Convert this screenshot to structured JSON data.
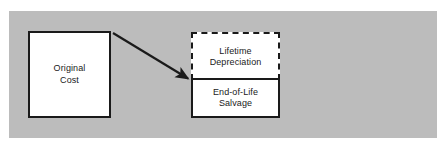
{
  "diagram": {
    "panel_color": "#bcbcbc",
    "page_background": "#ffffff",
    "line_color": "#1a1a1a",
    "box_fill": "#ffffff",
    "nodes": {
      "original_cost": {
        "label": "Original\nCost",
        "border_style": "solid"
      },
      "lifetime_depreciation": {
        "label": "Lifetime\nDepreciation",
        "border_style": "dashed"
      },
      "end_of_life_salvage": {
        "label": "End-of-Life\nSalvage",
        "border_style": "solid"
      }
    },
    "connector": {
      "name": "arrow-original-cost-to-split",
      "from": "original_cost",
      "to": "value_split_boundary",
      "style": "solid-arrow"
    }
  }
}
